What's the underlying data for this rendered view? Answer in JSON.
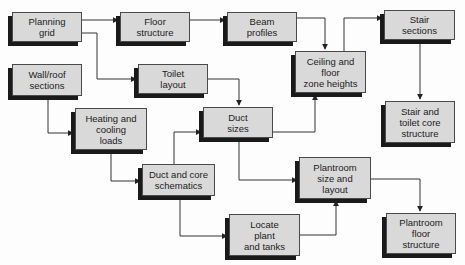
{
  "diagram": {
    "type": "flowchart",
    "colors": {
      "box_fill": "#d9d9d9",
      "box_border": "#4a4a4a",
      "shadow": "#1a1a1a",
      "line": "#333333"
    },
    "nodes": [
      {
        "id": "planning_grid",
        "label": "Planning\ngrid",
        "x": 12,
        "y": 12,
        "w": 70,
        "h": 30
      },
      {
        "id": "floor_structure",
        "label": "Floor\nstructure",
        "x": 120,
        "y": 12,
        "w": 70,
        "h": 30
      },
      {
        "id": "beam_profiles",
        "label": "Beam\nprofiles",
        "x": 227,
        "y": 12,
        "w": 70,
        "h": 30
      },
      {
        "id": "stair_sections",
        "label": "Stair\nsections",
        "x": 384,
        "y": 10,
        "w": 71,
        "h": 30
      },
      {
        "id": "wall_roof",
        "label": "Wall/roof\nsections",
        "x": 12,
        "y": 64,
        "w": 70,
        "h": 32
      },
      {
        "id": "toilet_layout",
        "label": "Toilet\nlayout",
        "x": 138,
        "y": 64,
        "w": 70,
        "h": 30
      },
      {
        "id": "ceiling_floor",
        "label": "Ceiling and\nfloor\nzone heights",
        "x": 295,
        "y": 51,
        "w": 71,
        "h": 42
      },
      {
        "id": "stair_toilet_core",
        "label": "Stair and\ntoilet core\nstructure",
        "x": 385,
        "y": 101,
        "w": 70,
        "h": 42
      },
      {
        "id": "heating_cooling",
        "label": "Heating and\ncooling\nloads",
        "x": 75,
        "y": 108,
        "w": 72,
        "h": 42
      },
      {
        "id": "duct_sizes",
        "label": "Duct\nsizes",
        "x": 203,
        "y": 107,
        "w": 70,
        "h": 31
      },
      {
        "id": "duct_core",
        "label": "Duct and core\nschematics",
        "x": 142,
        "y": 164,
        "w": 73,
        "h": 32
      },
      {
        "id": "plantroom_size",
        "label": "Plantroom\nsize and\nlayout",
        "x": 299,
        "y": 157,
        "w": 72,
        "h": 42
      },
      {
        "id": "locate_plant",
        "label": "Locate\nplant\nand tanks",
        "x": 229,
        "y": 214,
        "w": 71,
        "h": 42
      },
      {
        "id": "plantroom_floor",
        "label": "Plantroom\nfloor\nstructure",
        "x": 386,
        "y": 213,
        "w": 70,
        "h": 41
      }
    ],
    "edges": [
      {
        "from": "planning_grid",
        "to": "floor_structure",
        "path": "M82,20 L118,20"
      },
      {
        "from": "planning_grid",
        "to": "toilet_layout",
        "path": "M82,33 L97,33 L97,79 L136,79"
      },
      {
        "from": "floor_structure",
        "to": "beam_profiles",
        "path": "M190,20 L225,20"
      },
      {
        "from": "beam_profiles",
        "to": "ceiling_floor",
        "path": "M297,18 L325,18 L325,49"
      },
      {
        "from": "ceiling_floor",
        "to": "stair_sections",
        "path": "M344,51 L344,18 L382,18"
      },
      {
        "from": "stair_sections",
        "to": "stair_toilet_core",
        "path": "M420,40 L420,99"
      },
      {
        "from": "toilet_layout",
        "to": "duct_sizes",
        "path": "M208,79 L239,79 L239,105"
      },
      {
        "from": "wall_roof",
        "to": "heating_cooling",
        "path": "M48,96 L48,133 L73,133"
      },
      {
        "from": "heating_cooling",
        "to": "duct_core",
        "path": "M111,150 L111,181 L140,181"
      },
      {
        "from": "duct_core",
        "to": "duct_sizes",
        "path": "M174,164 L174,132 L201,132"
      },
      {
        "from": "duct_sizes",
        "to": "ceiling_floor",
        "path": "M273,132 L315,132 L315,95"
      },
      {
        "from": "duct_sizes",
        "to": "plantroom_size",
        "path": "M239,138 L239,180 L297,180"
      },
      {
        "from": "duct_core",
        "to": "locate_plant",
        "path": "M180,196 L180,236 L227,236"
      },
      {
        "from": "locate_plant",
        "to": "plantroom_size",
        "path": "M300,235 L336,235 L336,201"
      },
      {
        "from": "plantroom_size",
        "to": "plantroom_floor",
        "path": "M371,179 L420,179 L420,211"
      }
    ]
  }
}
